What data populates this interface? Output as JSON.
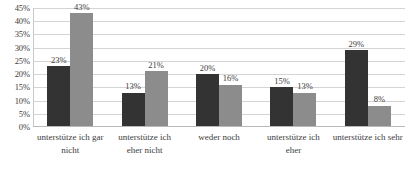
{
  "chart_data": {
    "type": "bar",
    "title": "",
    "subtitle": "",
    "xlabel": "",
    "ylabel": "",
    "ylim": [
      0,
      45
    ],
    "ytick_step": 5,
    "ytick_labels": [
      "45%",
      "40%",
      "35%",
      "30%",
      "25%",
      "20%",
      "15%",
      "10%",
      "5%",
      "0%"
    ],
    "ytick_values": [
      45,
      40,
      35,
      30,
      25,
      20,
      15,
      10,
      5,
      0
    ],
    "grid": true,
    "legend": false,
    "legend_position": "none",
    "categories": [
      "unterstütze ich gar nicht",
      "unterstütze ich eher nicht",
      "weder noch",
      "unterstütze ich eher",
      "unterstütze ich sehr"
    ],
    "series": [
      {
        "name": "series-1",
        "color": "#333333",
        "values": [
          23,
          13,
          20,
          15,
          29
        ],
        "labels": [
          "23%",
          "13%",
          "20%",
          "15%",
          "29%"
        ]
      },
      {
        "name": "series-2",
        "color": "#8c8c8c",
        "values": [
          43,
          21,
          16,
          13,
          8
        ],
        "labels": [
          "43%",
          "21%",
          "16%",
          "13%",
          "8%"
        ]
      }
    ]
  }
}
